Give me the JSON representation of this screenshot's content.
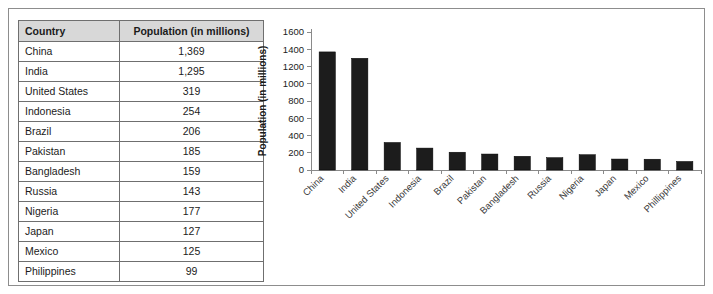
{
  "table": {
    "headers": [
      "Country",
      "Population (in millions)"
    ],
    "rows": [
      {
        "country": "China",
        "population": "1,369"
      },
      {
        "country": "India",
        "population": "1,295"
      },
      {
        "country": "United States",
        "population": "319"
      },
      {
        "country": "Indonesia",
        "population": "254"
      },
      {
        "country": "Brazil",
        "population": "206"
      },
      {
        "country": "Pakistan",
        "population": "185"
      },
      {
        "country": "Bangladesh",
        "population": "159"
      },
      {
        "country": "Russia",
        "population": "143"
      },
      {
        "country": "Nigeria",
        "population": "177"
      },
      {
        "country": "Japan",
        "population": "127"
      },
      {
        "country": "Mexico",
        "population": "125"
      },
      {
        "country": "Philippines",
        "population": "99"
      }
    ]
  },
  "chart_data": {
    "type": "bar",
    "title": "",
    "xlabel": "",
    "ylabel": "Population (in millions)",
    "ylim": [
      0,
      1600
    ],
    "ytick_step": 200,
    "yticks": [
      "0",
      "200",
      "400",
      "600",
      "800",
      "1000",
      "1200",
      "1400",
      "1600"
    ],
    "grid": false,
    "legend": false,
    "bar_color": "#1c1c1c",
    "categories": [
      "China",
      "India",
      "United States",
      "Indonesia",
      "Brazil",
      "Pakistan",
      "Bangladesh",
      "Russia",
      "Nigeria",
      "Japan",
      "Mexico",
      "Phillippines"
    ],
    "values": [
      1369,
      1295,
      319,
      254,
      206,
      185,
      159,
      143,
      177,
      127,
      125,
      99
    ]
  }
}
